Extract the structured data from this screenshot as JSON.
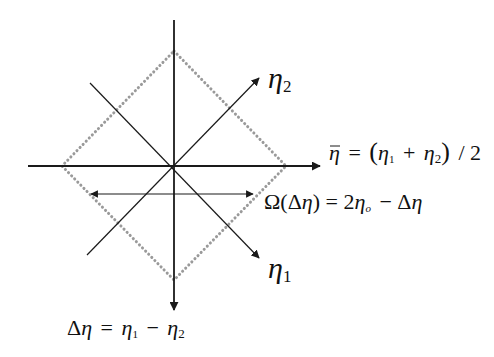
{
  "diagram": {
    "colors": {
      "line": "#1a1a1a",
      "dotted": "#9a9a9a",
      "background": "#ffffff"
    },
    "axes": {
      "vertical": {
        "name": "delta-eta-axis",
        "label": "Δη = η₁ − η₂"
      },
      "horizontal": {
        "name": "eta-bar-axis",
        "label": "η̄ = (η₁ + η₂) / 2"
      },
      "diag_up": {
        "name": "eta2-axis",
        "label": "η₂"
      },
      "diag_down": {
        "name": "eta1-axis",
        "label": "η₁"
      }
    },
    "labels": {
      "eta2": {
        "sym": "η",
        "sub": "2"
      },
      "eta1": {
        "sym": "η",
        "sub": "1"
      },
      "eta_bar": {
        "lhs": "η",
        "eq": "=",
        "open": "(",
        "t1": "η",
        "s1": "1",
        "plus": "+",
        "t2": "η",
        "s2": "2",
        "close": ")",
        "div": "/ 2"
      },
      "omega": {
        "lhs": "Ω(Δ",
        "eta": "η",
        "mid": ") = 2",
        "eta_o": "η",
        "sub_o": "o",
        "minus": "− Δ",
        "eta_end": "η"
      },
      "delta_eta": {
        "delta": "Δ",
        "eta": "η",
        "eq": "=",
        "e1": "η",
        "s1": "1",
        "minus": "−",
        "e2": "η",
        "s2": "2"
      }
    },
    "region": {
      "name": "diamond-region",
      "shape": "square rotated 45°, dotted outline"
    },
    "width_arrow": {
      "name": "omega-width-arrow",
      "description": "double-headed arrow spanning diamond width at given Δη"
    }
  }
}
